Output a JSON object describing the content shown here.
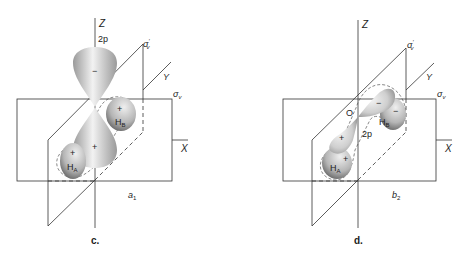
{
  "panels": [
    {
      "id": "c",
      "caption": "c.",
      "symmetry_label": "a",
      "symmetry_sub": "1",
      "axis_z": "Z",
      "axis_y": "Y",
      "axis_x": "X",
      "plane_sigma_v": "σ",
      "plane_sigma_v_sub": "v",
      "plane_sigma_v_prime": "σ",
      "plane_sigma_v_prime_sup": "′",
      "plane_sigma_v_prime_sub": "v",
      "orbital_label": "2p",
      "lobe_upper_sign": "−",
      "lobe_lower_sign": "+",
      "hA_label": "H",
      "hA_sub": "A",
      "hA_sign": "+",
      "hB_label": "H",
      "hB_sub": "B",
      "hB_sign": "+"
    },
    {
      "id": "d",
      "caption": "d.",
      "symmetry_label": "b",
      "symmetry_sub": "2",
      "axis_z": "Z",
      "axis_y": "Y",
      "axis_x": "X",
      "plane_sigma_v": "σ",
      "plane_sigma_v_sub": "v",
      "plane_sigma_v_prime": "σ",
      "plane_sigma_v_prime_sup": "′",
      "plane_sigma_v_prime_sub": "v",
      "origin_label": "O",
      "orbital_label": "2p",
      "lobe_upper_sign": "−",
      "lobe_lower_sign": "+",
      "hA_label": "H",
      "hA_sub": "A",
      "hA_sign": "+",
      "hB_label": "H",
      "hB_sub": "B",
      "hB_sign": "−"
    }
  ],
  "colors": {
    "line": "#333333",
    "lobe_light": "#e6e6e6",
    "lobe_dark": "#8a8a8a",
    "h_dark": "#555555"
  }
}
